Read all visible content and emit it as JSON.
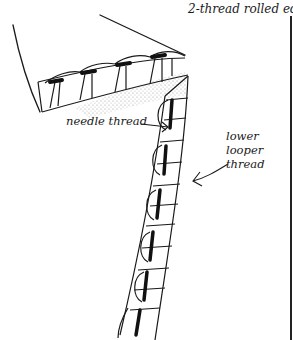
{
  "figure": {
    "title": "2-thread rolled edge",
    "labels": {
      "needle_thread": "needle thread",
      "lower_looper_line1": "lower",
      "lower_looper_line2": "looper",
      "lower_looper_line3": "thread"
    },
    "colors": {
      "ink": "#1a1a1a",
      "background": "#ffffff",
      "shading": "#bdbdbd"
    }
  }
}
